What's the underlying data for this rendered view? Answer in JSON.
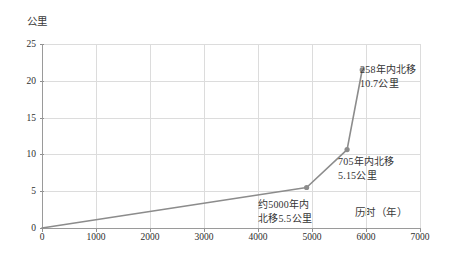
{
  "chart_data": {
    "type": "line",
    "title": "",
    "subtitle": "",
    "xlabel": "历时（年）",
    "ylabel": "公里",
    "xlim": [
      0,
      7000
    ],
    "ylim": [
      0,
      25
    ],
    "grid": true,
    "legend": "none",
    "x_ticks": [
      0,
      1000,
      2000,
      3000,
      4000,
      5000,
      6000,
      7000
    ],
    "y_ticks": [
      0,
      5,
      10,
      15,
      20,
      25
    ],
    "x_tick_labels": [
      "0",
      "1000",
      "2000",
      "3000",
      "4000",
      "5000",
      "6000",
      "7000"
    ],
    "y_tick_labels": [
      "0",
      "5",
      "10",
      "15",
      "20",
      "25"
    ],
    "series": [
      {
        "name": "北移距离",
        "color": "#8c8c8c",
        "marker": "circle",
        "x": [
          0,
          4900,
          5650,
          5930
        ],
        "y": [
          0,
          5.5,
          10.65,
          21.5
        ],
        "points": [
          {
            "x": 0,
            "y": 0
          },
          {
            "x": 4900,
            "y": 5.5
          },
          {
            "x": 5650,
            "y": 10.65
          },
          {
            "x": 5930,
            "y": 21.5
          }
        ]
      }
    ],
    "annotations": [
      {
        "id": "anno-0",
        "text_line1": "约5000年内",
        "text_line2": "北移5.5公里",
        "x": 4900,
        "y": 5.5
      },
      {
        "id": "anno-1",
        "text_line1": "705年内北移",
        "text_line2": "5.15公里",
        "x": 5650,
        "y": 10.65
      },
      {
        "id": "anno-2",
        "text_line1": "258年内北移",
        "text_line2": "10.7公里",
        "x": 5930,
        "y": 21.5
      }
    ]
  },
  "axes": {
    "y_title": "公里",
    "x_title": "历时（年）"
  },
  "colors": {
    "line": "#8c8c8c",
    "marker": "#8c8c8c",
    "grid": "#dcdcdc",
    "axis": "#9a9a9a",
    "text": "#2e2e2e",
    "background": "#ffffff"
  },
  "annotations": {
    "a0": {
      "l1": "约5000年内",
      "l2": "北移5.5公里"
    },
    "a1": {
      "l1": "705年内北移",
      "l2": "5.15公里"
    },
    "a2": {
      "l1": "258年内北移",
      "l2": "10.7公里"
    }
  }
}
